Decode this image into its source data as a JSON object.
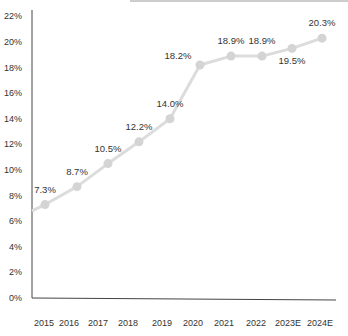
{
  "chart_data": {
    "type": "line",
    "title": "",
    "xlabel": "",
    "ylabel": "",
    "categories": [
      "2015",
      "2016",
      "2017",
      "2018",
      "2019",
      "2020",
      "2021",
      "2022",
      "2023E",
      "2024E"
    ],
    "series": [
      {
        "name": "Rate",
        "values": [
          7.3,
          8.7,
          10.5,
          12.2,
          14.0,
          18.2,
          18.9,
          18.9,
          19.5,
          20.3
        ],
        "labels": [
          "7.3%",
          "8.7%",
          "10.5%",
          "12.2%",
          "14.0%",
          "18.2%",
          "18.9%",
          "18.9%",
          "19.5%",
          "20.3%"
        ]
      }
    ],
    "line_start_value": 6.8,
    "ylim": [
      0,
      22
    ],
    "y_ticks": [
      "0%",
      "2%",
      "4%",
      "6%",
      "8%",
      "10%",
      "12%",
      "14%",
      "16%",
      "18%",
      "20%",
      "22%"
    ],
    "grid": false,
    "legend": "none",
    "colors": {
      "line": "#dcdcdc",
      "marker": "#d4d4d4",
      "axis": "#444444",
      "text": "#333333"
    }
  }
}
